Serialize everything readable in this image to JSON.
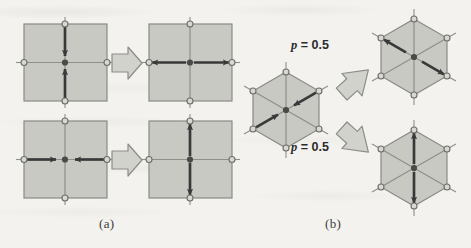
{
  "figure": {
    "background_color": "#f3f2ef",
    "cell_fill": "#c9c9c4",
    "cell_stroke": "#8a8a85",
    "lattice_line_color": "#8f8f8a",
    "node_fill": "#d8d8d3",
    "node_stroke": "#6e6e69",
    "center_node_fill": "#4a4a46",
    "arrow_color": "#39393a",
    "block_arrow_fill": "#d2d2cd",
    "block_arrow_stroke": "#8d8d88"
  },
  "panels": [
    {
      "id": "a",
      "label": "(a)",
      "shape": "square",
      "transitions": [
        {
          "id": "a-row-1",
          "before": {
            "name": "square-vertical-inward",
            "axis": "vertical",
            "direction": "inward",
            "arrows": [
              {
                "from": "top",
                "to": "center",
                "orientation": "down"
              },
              {
                "from": "bottom",
                "to": "center",
                "orientation": "up"
              }
            ]
          },
          "after": {
            "name": "square-horizontal-outward",
            "axis": "horizontal",
            "direction": "outward",
            "arrows": [
              {
                "from": "center",
                "to": "left",
                "orientation": "left"
              },
              {
                "from": "center",
                "to": "right",
                "orientation": "right"
              }
            ]
          },
          "connector": "block-arrow-right"
        },
        {
          "id": "a-row-2",
          "before": {
            "name": "square-horizontal-inward",
            "axis": "horizontal",
            "direction": "inward",
            "arrows": [
              {
                "from": "left",
                "to": "center",
                "orientation": "right"
              },
              {
                "from": "right",
                "to": "center",
                "orientation": "left"
              }
            ]
          },
          "after": {
            "name": "square-vertical-outward",
            "axis": "vertical",
            "direction": "outward",
            "arrows": [
              {
                "from": "center",
                "to": "top",
                "orientation": "up"
              },
              {
                "from": "center",
                "to": "bottom",
                "orientation": "down"
              }
            ]
          },
          "connector": "block-arrow-right"
        }
      ]
    },
    {
      "id": "b",
      "label": "(b)",
      "shape": "hexagon",
      "source": {
        "name": "hexagon-diag-ne-sw-inward",
        "axis": "ne-sw-diagonal",
        "direction": "inward",
        "arrows": [
          {
            "from": "upper-right",
            "to": "center",
            "orientation": "down-left"
          },
          {
            "from": "lower-left",
            "to": "center",
            "orientation": "up-right"
          }
        ]
      },
      "branches": [
        {
          "id": "b-branch-up",
          "probability_label": "p = 0.5",
          "probability_symbol": "p",
          "probability_value": "0.5",
          "connector": "block-arrow-up-right",
          "result": {
            "name": "hexagon-diag-nw-se-outward",
            "axis": "nw-se-diagonal",
            "direction": "outward",
            "arrows": [
              {
                "from": "center",
                "to": "upper-left",
                "orientation": "up-left"
              },
              {
                "from": "center",
                "to": "lower-right",
                "orientation": "down-right"
              }
            ]
          }
        },
        {
          "id": "b-branch-down",
          "probability_label": "p = 0.5",
          "probability_symbol": "p",
          "probability_value": "0.5",
          "connector": "block-arrow-down-right",
          "result": {
            "name": "hexagon-vertical-outward",
            "axis": "vertical",
            "direction": "outward",
            "arrows": [
              {
                "from": "center",
                "to": "top",
                "orientation": "up"
              },
              {
                "from": "center",
                "to": "bottom",
                "orientation": "down"
              }
            ]
          }
        }
      ]
    }
  ]
}
